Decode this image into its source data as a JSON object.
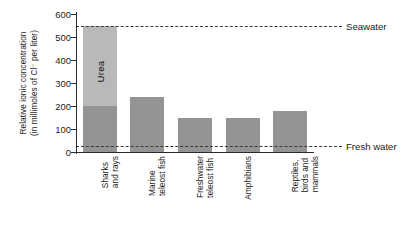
{
  "chart_data": {
    "type": "bar",
    "title": "",
    "subtitle": "",
    "xlabel": "",
    "ylabel_line1": "Relative ionic concentration",
    "ylabel_line2": "(in millimoles of Cl⁻ per liter)",
    "ylim": [
      0,
      600
    ],
    "yticks": [
      0,
      100,
      200,
      300,
      400,
      500,
      600
    ],
    "ytick_labels": [
      "0",
      "100",
      "200",
      "300",
      "400",
      "500",
      "600"
    ],
    "grid": false,
    "legend": "none",
    "categories": [
      "Sharks and rays",
      "Marine teleost fish",
      "Freshwater teleost fish",
      "Amphibians",
      "Reptiles, birds and mammals"
    ],
    "category_lines": [
      [
        "Sharks",
        "and rays"
      ],
      [
        "Marine",
        "teleost fish"
      ],
      [
        "Freshwater",
        "teleost fish"
      ],
      [
        "Amphibians"
      ],
      [
        "Reptiles,",
        "birds and",
        "mammals"
      ]
    ],
    "series": [
      {
        "name": "Ionic concentration",
        "color": "#949494",
        "values": [
          200,
          240,
          150,
          150,
          180
        ]
      },
      {
        "name": "Urea",
        "color": "#b9b9b9",
        "values": [
          350,
          0,
          0,
          0,
          0
        ]
      }
    ],
    "totals": [
      550,
      240,
      150,
      150,
      180
    ],
    "bar_inner_labels": [
      "Urea",
      "",
      "",
      "",
      ""
    ],
    "annotations": [
      {
        "label": "Seawater",
        "value": 550,
        "style": "dashed"
      },
      {
        "label": "Fresh water",
        "value": 25,
        "style": "dashed"
      }
    ]
  },
  "colors": {
    "bar_dark": "#949494",
    "bar_light": "#b9b9b9",
    "axis": "#2b2b2b",
    "text": "#1a1a1a",
    "refline": "#3a3a3a",
    "background": "#ffffff"
  }
}
